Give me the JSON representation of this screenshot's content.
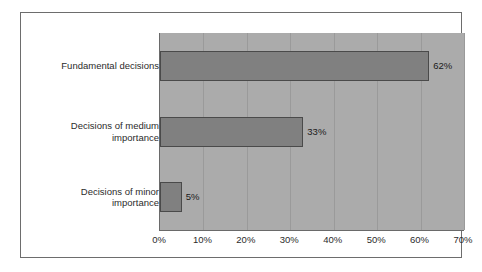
{
  "chart_data": {
    "type": "bar",
    "orientation": "horizontal",
    "title": "",
    "subtitle": "",
    "xlabel": "",
    "ylabel": "",
    "categories": [
      "Fundamental decisions",
      "Decisions of medium\nimportance",
      "Decisions of minor\nimportance"
    ],
    "values": [
      62,
      33,
      5
    ],
    "data_labels": [
      "62%",
      "33%",
      "5%"
    ],
    "xlim": [
      0,
      70
    ],
    "xticks": [
      0,
      10,
      20,
      30,
      40,
      50,
      60,
      70
    ],
    "xtick_labels": [
      "0%",
      "10%",
      "20%",
      "30%",
      "40%",
      "50%",
      "60%",
      "70%"
    ],
    "grid": true,
    "grid_axis": "x",
    "legend": false,
    "legend_position": "none",
    "colors": {
      "bar_fill": "#808080",
      "bar_border": "#4a4a4a",
      "plot_background": "#ababab",
      "gridline": "#9a9a9a",
      "axis_line": "#6a6a6a",
      "frame_border": "#6d6d6d",
      "figure_background": "#ffffff",
      "text": "#2b2b2b"
    }
  }
}
